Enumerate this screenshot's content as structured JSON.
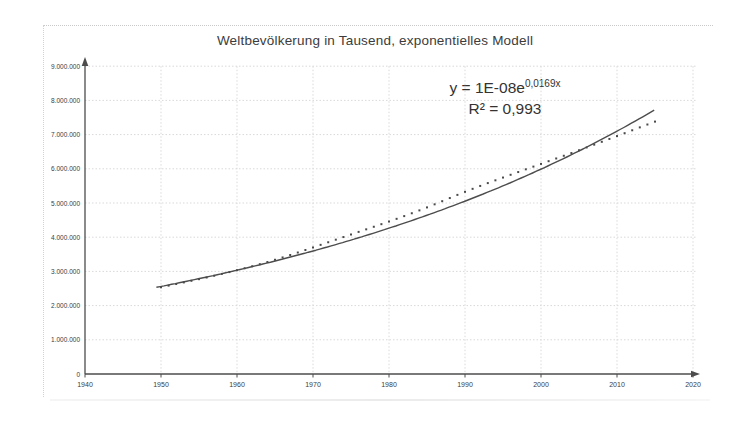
{
  "chart_data": {
    "type": "scatter",
    "title": "Weltbevölkerung in Tausend, exponentielles Modell",
    "xlabel": "",
    "ylabel": "",
    "xlim": [
      1940,
      2020
    ],
    "ylim": [
      0,
      9000000
    ],
    "grid": true,
    "legend": "none",
    "x_ticks": [
      1940,
      1950,
      1960,
      1970,
      1980,
      1990,
      2000,
      2010,
      2020
    ],
    "y_ticks": [
      {
        "label": "0",
        "value": 0
      },
      {
        "label": "1.000.000",
        "value": 1000000
      },
      {
        "label": "2.000.000",
        "value": 2000000
      },
      {
        "label": "3.000.000",
        "value": 3000000
      },
      {
        "label": "4.000.000",
        "value": 4000000
      },
      {
        "label": "5.000.000",
        "value": 5000000
      },
      {
        "label": "6.000.000",
        "value": 6000000
      },
      {
        "label": "7.000.000",
        "value": 7000000
      },
      {
        "label": "8.000.000",
        "value": 8000000
      },
      {
        "label": "9.000.000",
        "value": 9000000
      }
    ],
    "x": [
      1950,
      1951,
      1952,
      1953,
      1954,
      1955,
      1956,
      1957,
      1958,
      1959,
      1960,
      1961,
      1962,
      1963,
      1964,
      1965,
      1966,
      1967,
      1968,
      1969,
      1970,
      1971,
      1972,
      1973,
      1974,
      1975,
      1976,
      1977,
      1978,
      1979,
      1980,
      1981,
      1982,
      1983,
      1984,
      1985,
      1986,
      1987,
      1988,
      1989,
      1990,
      1991,
      1992,
      1993,
      1994,
      1995,
      1996,
      1997,
      1998,
      1999,
      2000,
      2001,
      2002,
      2003,
      2004,
      2005,
      2006,
      2007,
      2008,
      2009,
      2010,
      2011,
      2012,
      2013,
      2014,
      2015
    ],
    "series": [
      {
        "name": "Weltbevölkerung in Tausend",
        "marker": "dot",
        "values": [
          2536000,
          2584000,
          2631000,
          2678000,
          2725000,
          2773000,
          2822000,
          2873000,
          2926000,
          2980000,
          3035000,
          3092000,
          3150000,
          3211000,
          3274000,
          3340000,
          3408000,
          3479000,
          3552000,
          3626000,
          3700000,
          3776000,
          3852000,
          3928000,
          4004000,
          4079000,
          4155000,
          4230000,
          4305000,
          4381000,
          4458000,
          4537000,
          4617000,
          4700000,
          4784000,
          4871000,
          4961000,
          5053000,
          5145000,
          5237000,
          5327000,
          5414000,
          5499000,
          5582000,
          5663000,
          5744000,
          5825000,
          5905000,
          5985000,
          6064000,
          6143000,
          6223000,
          6302000,
          6381000,
          6461000,
          6542000,
          6624000,
          6706000,
          6789000,
          6873000,
          6957000,
          7041000,
          7126000,
          7211000,
          7295000,
          7380000
        ]
      }
    ],
    "trendline": {
      "equation_prefix": "y = 1E-08e",
      "equation_exponent": "0,0169x",
      "r_squared": "R² = 0,993",
      "model": {
        "value_at_1950": 2560000,
        "growth_rate": 0.017,
        "x_start": 1949.4,
        "x_end": 2015.3
      }
    },
    "colors": {
      "ink": "#3c3c3c",
      "curve": "#4d4d4d",
      "dots": "#4a4a4a",
      "grid": "#d9d9d9",
      "axis": "#4c4c4c",
      "frame": "#c9c9c9"
    }
  }
}
